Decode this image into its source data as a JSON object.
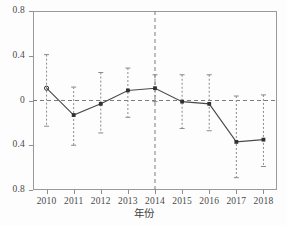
{
  "chart_data": {
    "type": "line",
    "title": "",
    "subtitle": "",
    "xlabel": "年份",
    "ylabel": "",
    "categories": [
      "2010",
      "2011",
      "2012",
      "2013",
      "2014",
      "2015",
      "2016",
      "2017",
      "2018"
    ],
    "values": [
      0.11,
      -0.13,
      -0.03,
      0.09,
      0.11,
      -0.01,
      -0.03,
      -0.37,
      -0.35
    ],
    "error_low": [
      -0.23,
      -0.4,
      -0.29,
      -0.15,
      -0.01,
      -0.25,
      -0.27,
      -0.69,
      -0.59
    ],
    "error_high": [
      0.41,
      0.12,
      0.25,
      0.29,
      0.23,
      0.23,
      0.23,
      0.04,
      0.05
    ],
    "series": [
      {
        "name": "估计值",
        "values": [
          0.11,
          -0.13,
          -0.03,
          0.09,
          0.11,
          -0.01,
          -0.03,
          -0.37,
          -0.35
        ]
      }
    ],
    "ylim": [
      -0.8,
      0.8
    ],
    "ytick_values": [
      0.8,
      0.4,
      0.0,
      -0.4,
      -0.8
    ],
    "ytick_labels": [
      "0.8",
      "0.4",
      "0",
      "0.4",
      "0.8"
    ],
    "xtick_labels": [
      "2010",
      "2011",
      "2012",
      "2013",
      "2014",
      "2015",
      "2016",
      "2017",
      "2018"
    ],
    "grid": false,
    "legend": "none",
    "annotations": [
      {
        "type": "hline",
        "value": 0,
        "style": "dashed",
        "name": "zero-reference-line"
      },
      {
        "type": "vline",
        "category": "2014",
        "style": "dashed",
        "name": "policy-year-line"
      }
    ],
    "colors": {
      "line": "#4a4a4a",
      "marker": "#303030",
      "errorbar": "#8a8a8a",
      "reference": "#7d7d7d",
      "frame": "#9a9a9a",
      "background": "#fdfdfd"
    }
  },
  "axis": {
    "x_title": "年份"
  }
}
